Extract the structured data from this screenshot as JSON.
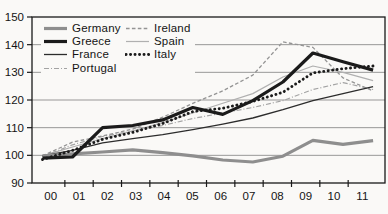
{
  "figure_bg": "#faf9f7",
  "axis_color": "#1a1a1a",
  "grid_color": "#6f6f6f",
  "text_color": "#141414",
  "chart_data": {
    "type": "line",
    "title": "",
    "xlabel": "",
    "ylabel": "",
    "x": [
      "00",
      "01",
      "02",
      "03",
      "04",
      "05",
      "06",
      "07",
      "08",
      "09",
      "10",
      "11"
    ],
    "ylim": [
      90,
      150
    ],
    "yticks": [
      90,
      100,
      110,
      120,
      130,
      140,
      150
    ],
    "grid": "horizontal gridlines on",
    "legend_position": "top-left inside plot, two columns",
    "series": [
      {
        "name": "Germany",
        "color": "#8e8e8e",
        "style": "solid",
        "width": 3.2,
        "values": [
          99.8,
          100.5,
          101.2,
          102,
          101,
          99.8,
          98.3,
          97.6,
          99.7,
          105.4,
          104,
          105.3
        ]
      },
      {
        "name": "Greece",
        "color": "#1b1b1b",
        "style": "solid",
        "width": 3.2,
        "values": [
          99,
          99.4,
          110,
          110.8,
          112.8,
          117.3,
          114.8,
          119.8,
          126.5,
          137,
          133.8,
          130.8
        ]
      },
      {
        "name": "France",
        "color": "#2c2c2c",
        "style": "solid",
        "width": 1.3,
        "values": [
          99.8,
          101.8,
          104.5,
          106,
          107.5,
          109.3,
          111.3,
          113.5,
          116.5,
          119.8,
          122.3,
          124.8
        ]
      },
      {
        "name": "Portugal",
        "color": "#a3a3a3",
        "style": "dashdot",
        "width": 1.2,
        "values": [
          99.5,
          103.8,
          106.8,
          108.8,
          110.8,
          113.3,
          115.3,
          117.3,
          119.8,
          123.8,
          126.3,
          123.8
        ]
      },
      {
        "name": "Ireland",
        "color": "#949494",
        "style": "dashed",
        "width": 1.3,
        "values": [
          99.8,
          104.8,
          107,
          109.5,
          113.8,
          118.8,
          123.3,
          129,
          141,
          139,
          128,
          123.3
        ]
      },
      {
        "name": "Spain",
        "color": "#b0b0b0",
        "style": "solid",
        "width": 1.2,
        "values": [
          99.8,
          103,
          106,
          108.8,
          111.8,
          115.3,
          118.8,
          122.3,
          128.3,
          132.3,
          130,
          127
        ]
      },
      {
        "name": "Italy",
        "color": "#1b1b1b",
        "style": "dotted",
        "width": 2.9,
        "values": [
          98.5,
          101.8,
          105.8,
          108.3,
          111.5,
          115.8,
          117,
          119.5,
          122.8,
          129.8,
          131.3,
          132.3
        ]
      }
    ],
    "legend_columns": [
      [
        "Germany",
        "Greece",
        "France",
        "Portugal"
      ],
      [
        "Ireland",
        "Spain",
        "Italy"
      ]
    ]
  }
}
